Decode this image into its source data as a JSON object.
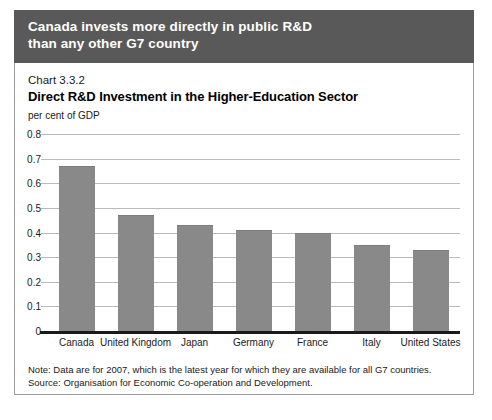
{
  "banner": {
    "line1": "Canada invests more directly in public R&D",
    "line2": "than any other G7 country",
    "background": "#595959",
    "text_color": "#ffffff"
  },
  "chart_number": "Chart 3.3.2",
  "notes": {
    "note": "Note: Data are for 2007, which is the latest year for which they are available for all G7 countries.",
    "source": "Source: Organisation for Economic Co-operation and Development."
  },
  "colors": {
    "bar": "#898989",
    "gridline": "#b9b9b9",
    "axis": "#1a1a1a",
    "frame": "#9a9a9a"
  },
  "chart_data": {
    "type": "bar",
    "title": "Direct R&D Investment in the Higher-Education Sector",
    "xlabel": "",
    "ylabel": "per cent of GDP",
    "categories": [
      "Canada",
      "United Kingdom",
      "Japan",
      "Germany",
      "France",
      "Italy",
      "United States"
    ],
    "values": [
      0.67,
      0.47,
      0.43,
      0.41,
      0.4,
      0.35,
      0.33
    ],
    "ylim": [
      0,
      0.8
    ],
    "yticks": [
      "0",
      "0.1",
      "0.2",
      "0.3",
      "0.4",
      "0.5",
      "0.6",
      "0.7",
      "0.8"
    ],
    "ytick_values": [
      0,
      0.1,
      0.2,
      0.3,
      0.4,
      0.5,
      0.6,
      0.7,
      0.8
    ],
    "grid": true,
    "legend": "none"
  }
}
